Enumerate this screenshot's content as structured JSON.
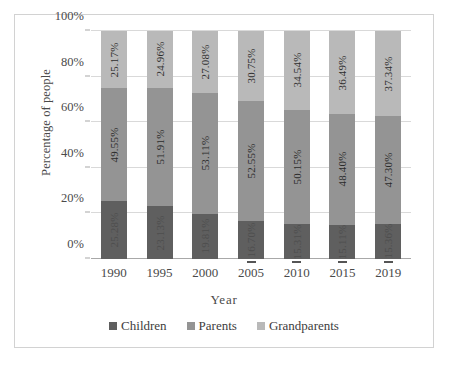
{
  "chart_data": {
    "type": "bar",
    "subtype": "stacked-100-percent",
    "title": "",
    "xlabel": "Year",
    "ylabel": "Percentage of people",
    "categories": [
      "1990",
      "1995",
      "2000",
      "2005",
      "2010",
      "2015",
      "2019"
    ],
    "ylim": [
      0,
      100
    ],
    "ytick_labels": [
      "0%",
      "20%",
      "40%",
      "60%",
      "80%",
      "100%"
    ],
    "ytick_values": [
      0,
      20,
      40,
      60,
      80,
      100
    ],
    "grid": true,
    "legend_position": "bottom",
    "series": [
      {
        "name": "Children",
        "color": "#5f5f5f",
        "values": [
          25.28,
          23.13,
          19.81,
          16.7,
          15.31,
          15.11,
          15.36
        ],
        "labels": [
          "25.28%",
          "23.13%",
          "19.81%",
          "16.70%",
          "15.31%",
          "15.11%",
          "15.36%"
        ]
      },
      {
        "name": "Parents",
        "color": "#949494",
        "values": [
          49.55,
          51.91,
          53.11,
          52.55,
          50.15,
          48.4,
          47.3
        ],
        "labels": [
          "49.55%",
          "51.91%",
          "53.11%",
          "52.55%",
          "50.15%",
          "48.40%",
          "47.30%"
        ]
      },
      {
        "name": "Grandparents",
        "color": "#b9b9b9",
        "values": [
          25.17,
          24.96,
          27.08,
          30.75,
          34.54,
          36.49,
          37.34
        ],
        "labels": [
          "25.17%",
          "24.96%",
          "27.08%",
          "30.75%",
          "34.54%",
          "36.49%",
          "37.34%"
        ]
      }
    ]
  }
}
